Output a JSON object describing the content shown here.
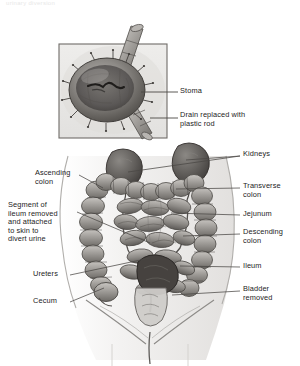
{
  "figure": {
    "title_faint": "urinary diversion",
    "style": {
      "ink": "#1c1c1c",
      "tissue_light": "#d8d6d2",
      "tissue_mid": "#9e9b97",
      "tissue_dark": "#6a6763",
      "tissue_deep": "#474441",
      "skin_outline": "#b9b7b4",
      "frame": "#6f6c68",
      "inset_bg": "#e9e8e6",
      "leader": "#4a4744"
    }
  },
  "inset": {
    "name": "stoma-detail-inset",
    "labels": [
      {
        "id": "stoma",
        "text": "Stoma",
        "x": 180,
        "y": 87,
        "leader_from_x": 166,
        "leader_from_y": 92,
        "leader_to_x": 141,
        "leader_to_y": 92
      },
      {
        "id": "drain-rod",
        "text": "Drain replaced with\nplastic rod",
        "x": 180,
        "y": 112,
        "leader_from_x": 166,
        "leader_from_y": 117,
        "leader_to_x": 145,
        "leader_to_y": 117
      }
    ]
  },
  "main": {
    "name": "abdominal-anatomy-figure",
    "labels_left": [
      {
        "id": "ascending-colon",
        "text": "Ascending\ncolon",
        "x": 35,
        "y": 170,
        "align": "left",
        "leader": [
          [
            79,
            175
          ],
          [
            103,
            188
          ]
        ]
      },
      {
        "id": "ileum-segment",
        "text": "Segment of\nileum removed\nand attached\nto skin to\ndivert urine",
        "x": 8,
        "y": 202,
        "align": "left",
        "leader": [
          [
            77,
            212
          ],
          [
            150,
            243
          ]
        ]
      },
      {
        "id": "ureters",
        "text": "Ureters",
        "x": 33,
        "y": 271,
        "align": "left",
        "leader": [
          [
            70,
            275
          ],
          [
            150,
            258
          ]
        ]
      },
      {
        "id": "cecum",
        "text": "Cecum",
        "x": 33,
        "y": 298,
        "align": "left",
        "leader": [
          [
            70,
            302
          ],
          [
            104,
            288
          ]
        ]
      }
    ],
    "labels_right": [
      {
        "id": "kidneys",
        "text": "Kidneys",
        "x": 243,
        "y": 151,
        "align": "left",
        "leader": [
          [
            240,
            156
          ],
          [
            186,
            160
          ]
        ],
        "leader2": [
          [
            240,
            156
          ],
          [
            128,
            172
          ]
        ]
      },
      {
        "id": "transverse-colon",
        "text": "Transverse\ncolon",
        "x": 243,
        "y": 183,
        "align": "left",
        "leader": [
          [
            240,
            188
          ],
          [
            176,
            189
          ]
        ]
      },
      {
        "id": "jejunum",
        "text": "Jejunum",
        "x": 243,
        "y": 211,
        "align": "left",
        "leader": [
          [
            240,
            215
          ],
          [
            171,
            213
          ]
        ]
      },
      {
        "id": "descending-colon",
        "text": "Descending\ncolon",
        "x": 243,
        "y": 229,
        "align": "left",
        "leader": [
          [
            240,
            234
          ],
          [
            183,
            236
          ]
        ]
      },
      {
        "id": "ileum",
        "text": "Ileum",
        "x": 243,
        "y": 263,
        "align": "left",
        "leader": [
          [
            240,
            267
          ],
          [
            180,
            266
          ]
        ]
      },
      {
        "id": "bladder-removed",
        "text": "Bladder\nremoved",
        "x": 243,
        "y": 286,
        "align": "left",
        "leader": [
          [
            240,
            291
          ],
          [
            172,
            295
          ]
        ]
      }
    ]
  }
}
